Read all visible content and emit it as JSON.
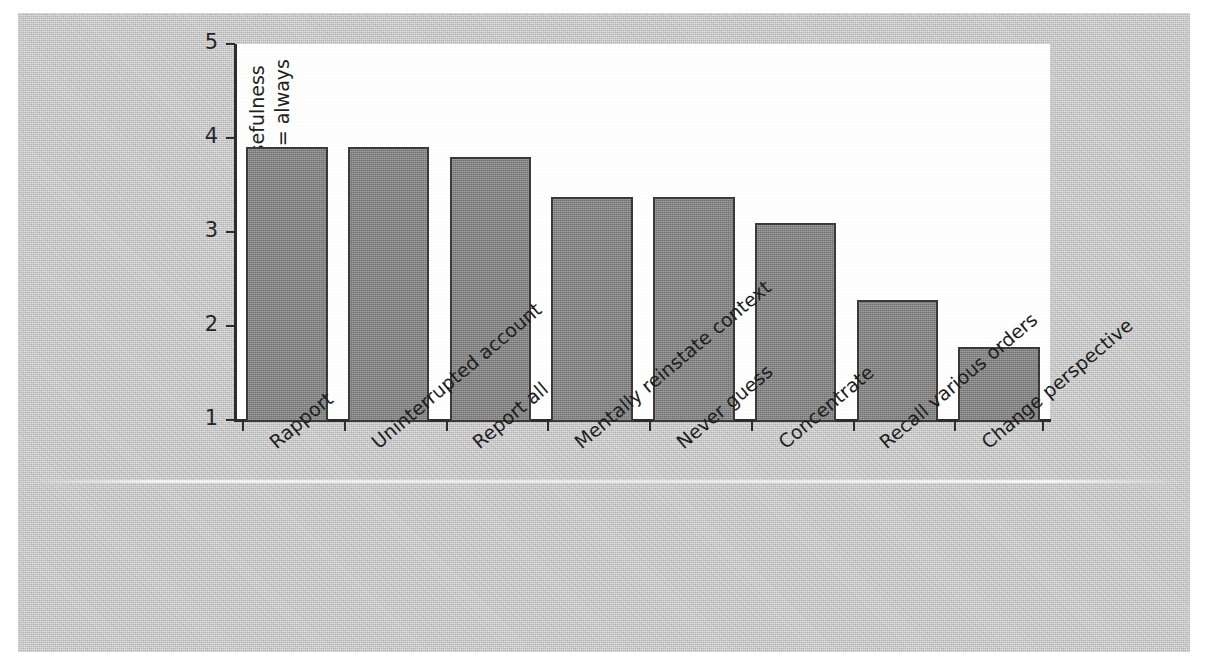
{
  "chart_data": {
    "type": "bar",
    "title": "",
    "xlabel": "",
    "ylabel_line1": "Perceived usefulness",
    "ylabel_line2": "1 = never, 5 = always",
    "categories": [
      "Rapport",
      "Uninterrupted account",
      "Report all",
      "Mentally reinstate context",
      "Never guess",
      "Concentrate",
      "Recall various orders",
      "Change perspective"
    ],
    "values": [
      3.9,
      3.9,
      3.8,
      3.37,
      3.37,
      3.1,
      2.28,
      1.78
    ],
    "ylim": [
      1,
      5
    ],
    "yticks": [
      "1",
      "2",
      "3",
      "4",
      "5"
    ],
    "ytick_values": [
      1,
      2,
      3,
      4,
      5
    ],
    "grid": false,
    "legend": "none",
    "bar_color": "#8a8a8a",
    "bar_edge_color": "#3a3a3a",
    "plot_background": "#ffffff",
    "page_background": "#c9c9c9",
    "axis_color": "#2d2d2d"
  }
}
